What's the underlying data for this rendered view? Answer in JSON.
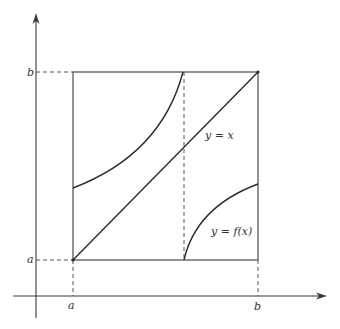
{
  "diagram": {
    "axis_labels": {
      "y_top": "b",
      "y_bottom": "a",
      "x_left": "a",
      "x_right": "b"
    },
    "curve_labels": {
      "identity": "y = x",
      "function": "y = f(x)"
    },
    "colors": {
      "line": "#2a2a2a",
      "background": "#ffffff"
    }
  }
}
